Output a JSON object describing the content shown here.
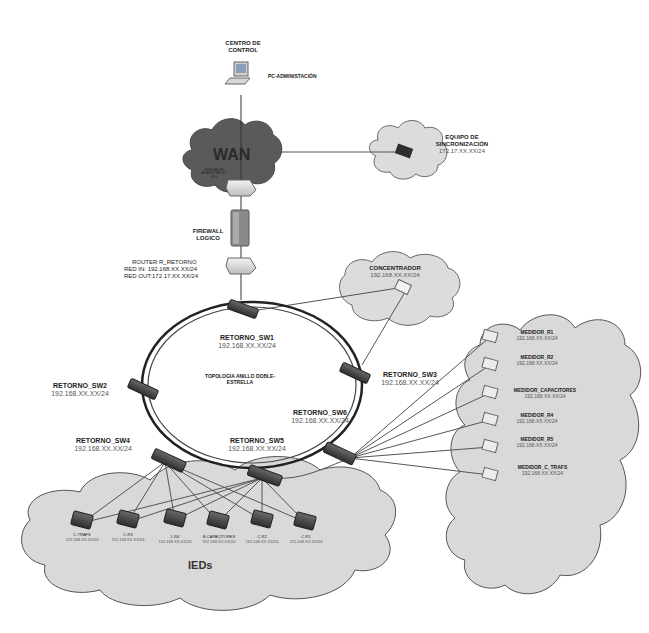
{
  "diagram": {
    "colors": {
      "cloud_dark": "#5a5a5a",
      "cloud_light": "#d9d9d9",
      "cloud_stroke": "#555555",
      "switch": "#4a4a4a",
      "line": "#555555",
      "ring": "#222222",
      "text": "#222222",
      "ip_text": "#555555"
    },
    "control_center": {
      "title_line1": "CENTRO DE",
      "title_line2": "CONTROL",
      "pc_label": "PC-ADMINISTACIÓN",
      "icon": "computer-icon"
    },
    "wan": {
      "label": "WAN",
      "icon": "cloud-icon"
    },
    "sync_equipment": {
      "line1": "EQUIPO DE",
      "line2": "SINCRONIZACIÓN",
      "ip": "172.17.XX.XX/24",
      "icon": "sync-device-icon"
    },
    "router_wan": {
      "line1": "ENRUTADOR",
      "line2": "ADMINISTRATIVO",
      "line3": "GSG",
      "icon": "router-icon"
    },
    "firewall": {
      "line1": "FIREWALL",
      "line2": "LOGICO",
      "icon": "firewall-icon"
    },
    "router_retorno": {
      "name": "ROUTER R_RETORNO",
      "red_in": "RED IN: 192.168.XX.XX/24",
      "red_out": "RED OUT:172.17.XX.XX/24",
      "icon": "router-icon"
    },
    "concentrador": {
      "name": "CONCENTRADOR",
      "ip": "192.168.XX.XX/24",
      "icon": "concentrator-icon"
    },
    "ring_label": {
      "line1": "TOPOLOGIA ANILLO DOBLE-",
      "line2": "ESTRELLA"
    },
    "switches": [
      {
        "name": "RETORNO_SW1",
        "ip": "192.168.XX.XX/24"
      },
      {
        "name": "RETORNO_SW2",
        "ip": "192.168.XX.XX/24"
      },
      {
        "name": "RETORNO_SW3",
        "ip": "192.168.XX.XX/24"
      },
      {
        "name": "RETORNO_SW4",
        "ip": "192.168.XX.XX/24"
      },
      {
        "name": "RETORNO_SW5",
        "ip": "192.168.XX.XX/24"
      },
      {
        "name": "RETORNO_SW6",
        "ip": "192.168.XX.XX/24"
      }
    ],
    "meters": [
      {
        "name": "MEDIDOR_R1",
        "ip": "192.168.XX.XX/24"
      },
      {
        "name": "MEDIDOR_R2",
        "ip": "192.168.XX.XX/24"
      },
      {
        "name": "MEDIDOR_CAPACITORES",
        "ip": "192.168.XX.XX/24"
      },
      {
        "name": "MEDIDOR_R4",
        "ip": "192.168.XX.XX/24"
      },
      {
        "name": "MEDIDOR_R5",
        "ip": "192.168.XX.XX/24"
      },
      {
        "name": "MEDIDOR_C_TRAFS",
        "ip": "192.168.XX.XX/24"
      }
    ],
    "ieds": {
      "group_label": "IEDs",
      "devices": [
        {
          "name": "C-TRAFS",
          "ip": "192.168.XX.XX/24"
        },
        {
          "name": "C-R3",
          "ip": "192.168.XX.XX/24"
        },
        {
          "name": "L-R4",
          "ip": "192.168.XX.XX/24"
        },
        {
          "name": "B-CAPACITORES",
          "ip": "192.168.XX.XX/24"
        },
        {
          "name": "C-R2",
          "ip": "192.168.XX.XX/24"
        },
        {
          "name": "C-R1",
          "ip": "192.168.XX.XX/24"
        }
      ]
    }
  }
}
